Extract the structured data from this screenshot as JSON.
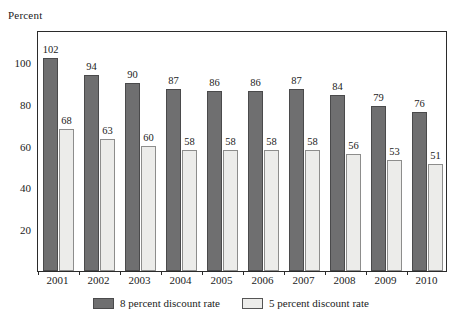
{
  "chart_data": {
    "type": "bar",
    "title": "",
    "ylabel": "Percent",
    "xlabel": "",
    "categories": [
      "2001",
      "2002",
      "2003",
      "2004",
      "2005",
      "2006",
      "2007",
      "2008",
      "2009",
      "2010"
    ],
    "series": [
      {
        "name": "8 percent discount rate",
        "color": "#6f6f70",
        "values": [
          102,
          94,
          90,
          87,
          86,
          86,
          87,
          84,
          79,
          76
        ]
      },
      {
        "name": "5 percent discount rate",
        "color": "#ececea",
        "values": [
          68,
          63,
          60,
          58,
          58,
          58,
          58,
          56,
          53,
          51
        ]
      }
    ],
    "ylim": [
      0,
      115
    ],
    "yticks": [
      20,
      40,
      60,
      80,
      100
    ],
    "ytick_labels": [
      "20",
      "40",
      "60",
      "80",
      "100"
    ],
    "grid": false,
    "legend_position": "bottom",
    "data_labels": true
  },
  "legend": {
    "items": [
      {
        "label": "8 percent discount rate",
        "swatch": "dark"
      },
      {
        "label": "5 percent discount rate",
        "swatch": "light"
      }
    ]
  }
}
